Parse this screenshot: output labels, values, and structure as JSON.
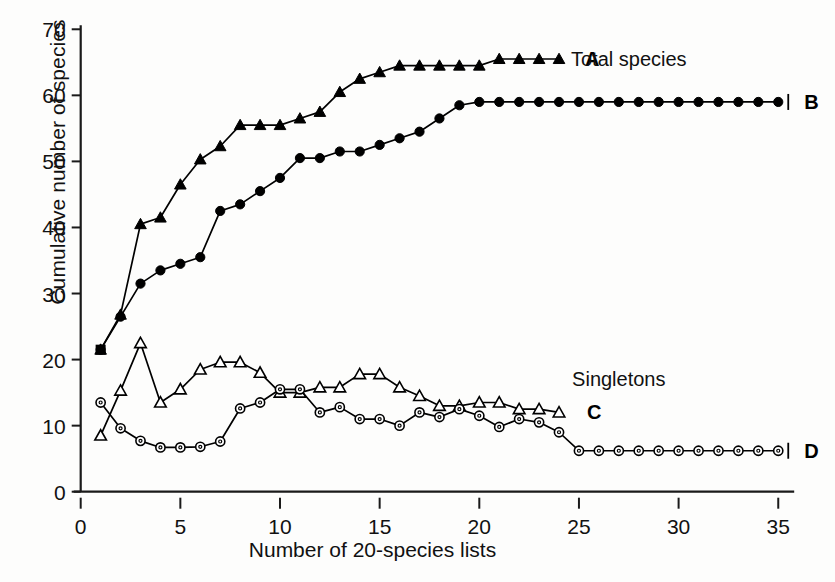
{
  "chart_data": {
    "type": "line",
    "title": "",
    "xlabel": "Number of 20-species lists",
    "ylabel": "Cumulative number of species",
    "xlim": [
      0,
      35.8
    ],
    "ylim": [
      0,
      70
    ],
    "xticks": [
      0,
      5,
      10,
      15,
      20,
      25,
      30,
      35
    ],
    "yticks": [
      0,
      10,
      20,
      30,
      40,
      50,
      60,
      70
    ],
    "grid": false,
    "legend_position": "inline-right",
    "annotations": [
      {
        "text": "Total species",
        "x": 27.5,
        "y": 65.5
      },
      {
        "text": "Singletons",
        "x": 27.0,
        "y": 17.0
      }
    ],
    "series": [
      {
        "name": "A",
        "label": "A",
        "group": "Total species",
        "marker": "filled-triangle",
        "color": "#000000",
        "x": [
          1,
          2,
          3,
          4,
          5,
          6,
          7,
          8,
          9,
          10,
          11,
          12,
          13,
          14,
          15,
          16,
          17,
          18,
          19,
          20,
          21,
          22,
          23,
          24
        ],
        "y": [
          21.5,
          26.8,
          40.5,
          41.5,
          46.5,
          50.3,
          52.3,
          55.5,
          55.5,
          55.5,
          56.5,
          57.5,
          60.5,
          62.5,
          63.5,
          64.5,
          64.5,
          64.5,
          64.5,
          64.5,
          65.5,
          65.5,
          65.5,
          65.5
        ]
      },
      {
        "name": "B",
        "label": "B",
        "group": "Total species",
        "marker": "filled-circle",
        "color": "#000000",
        "x": [
          1,
          2,
          3,
          4,
          5,
          6,
          7,
          8,
          9,
          10,
          11,
          12,
          13,
          14,
          15,
          16,
          17,
          18,
          19,
          20,
          21,
          22,
          23,
          24,
          25,
          26,
          27,
          28,
          29,
          30,
          31,
          32,
          33,
          34,
          35
        ],
        "y": [
          21.5,
          26.5,
          31.5,
          33.5,
          34.5,
          35.5,
          42.5,
          43.5,
          45.5,
          47.5,
          50.5,
          50.5,
          51.5,
          51.5,
          52.5,
          53.5,
          54.5,
          56.5,
          58.5,
          59.0,
          59.0,
          59.0,
          59.0,
          59.0,
          59.0,
          59.0,
          59.0,
          59.0,
          59.0,
          59.0,
          59.0,
          59.0,
          59.0,
          59.0,
          59.0
        ]
      },
      {
        "name": "C",
        "label": "C",
        "group": "Singletons",
        "marker": "open-triangle",
        "color": "#000000",
        "x": [
          1,
          2,
          3,
          4,
          5,
          6,
          7,
          8,
          9,
          10,
          11,
          12,
          13,
          14,
          15,
          16,
          17,
          18,
          19,
          20,
          21,
          22,
          23,
          24
        ],
        "y": [
          8.5,
          15.3,
          22.5,
          13.5,
          15.5,
          18.5,
          19.6,
          19.6,
          18.0,
          15.0,
          15.0,
          15.8,
          15.8,
          17.8,
          17.8,
          15.8,
          14.5,
          13.0,
          13.0,
          13.5,
          13.5,
          12.5,
          12.5,
          12.0
        ]
      },
      {
        "name": "D",
        "label": "D",
        "group": "Singletons",
        "marker": "open-circle",
        "color": "#000000",
        "x": [
          1,
          2,
          3,
          4,
          5,
          6,
          7,
          8,
          9,
          10,
          11,
          12,
          13,
          14,
          15,
          16,
          17,
          18,
          19,
          20,
          21,
          22,
          23,
          24,
          25,
          26,
          27,
          28,
          29,
          30,
          31,
          32,
          33,
          34,
          35
        ],
        "y": [
          13.5,
          9.6,
          7.7,
          6.7,
          6.7,
          6.8,
          7.6,
          12.6,
          13.5,
          15.5,
          15.5,
          12.0,
          12.8,
          11.0,
          11.0,
          10.0,
          12.0,
          11.3,
          12.5,
          11.5,
          9.8,
          11.0,
          10.5,
          9.0,
          6.2,
          6.2,
          6.2,
          6.2,
          6.2,
          6.2,
          6.2,
          6.2,
          6.2,
          6.2,
          6.2
        ]
      }
    ]
  },
  "axes": {
    "x_tick_labels": [
      "0",
      "5",
      "10",
      "15",
      "20",
      "25",
      "30",
      "35"
    ],
    "y_tick_labels": [
      "0",
      "10",
      "20",
      "30",
      "40",
      "50",
      "60",
      "70"
    ],
    "x_title": "Number of 20-species lists",
    "y_title": "Cumulative number of species"
  },
  "labels": {
    "a": "A",
    "b": "B",
    "c": "C",
    "d": "D",
    "total_species": "Total species",
    "singletons": "Singletons"
  }
}
